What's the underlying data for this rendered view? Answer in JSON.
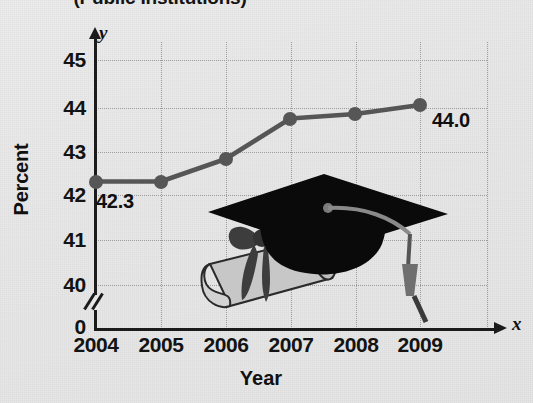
{
  "chart_data": {
    "type": "line",
    "title": "(Public Institutions)",
    "xlabel": "Year",
    "ylabel": "Percent",
    "x_axis_letter": "y",
    "y_axis_letter": "x",
    "categories": [
      "2004",
      "2005",
      "2006",
      "2007",
      "2008",
      "2009"
    ],
    "values": [
      42.3,
      42.3,
      42.8,
      43.7,
      43.8,
      44.0
    ],
    "point_labels": [
      "42.3",
      "",
      "",
      "",
      "",
      "44.0"
    ],
    "ylim": [
      40,
      45
    ],
    "y_ticks": [
      "45",
      "44",
      "43",
      "42",
      "41",
      "40",
      "0"
    ],
    "y_axis_break": true,
    "y_axis_break_symbol": "//",
    "grid": true,
    "grid_style": "dotted",
    "legend": "none",
    "marker": "circle",
    "line_color": "#565656",
    "marker_color": "#565656",
    "text_color": "#101010",
    "grid_color": "#9b9b9b",
    "background_color": "#e9e9e9",
    "decoration": "graduation-cap-and-diploma"
  },
  "axis_letters": {
    "y": "y",
    "x": "x"
  },
  "art": {
    "cap_label": "graduation-cap",
    "diploma_label": "diploma-scroll",
    "cap_color": "#0a0a0a",
    "diploma_color": "#c9c9c9",
    "ribbon_color": "#3d3d3d",
    "tassel_color": "#6f6f6f"
  }
}
